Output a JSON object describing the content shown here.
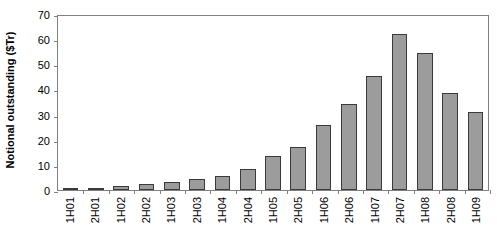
{
  "chart_data": {
    "type": "bar",
    "title": "",
    "xlabel": "",
    "ylabel": "Notional outstanding ($Tr)",
    "ylim": [
      0,
      70
    ],
    "yticks": [
      0,
      10,
      20,
      30,
      40,
      50,
      60,
      70
    ],
    "grid": false,
    "legend": null,
    "bar_color": "#9c9c9c",
    "bar_border_color": "#3a3a3a",
    "axis_color": "#808080",
    "categories": [
      "1H01",
      "2H01",
      "1H02",
      "2H02",
      "1H03",
      "2H03",
      "1H04",
      "2H04",
      "1H05",
      "2H05",
      "1H06",
      "2H06",
      "1H07",
      "2H07",
      "1H08",
      "2H08",
      "1H09"
    ],
    "values": [
      0.6,
      0.9,
      1.6,
      2.2,
      3.0,
      4.4,
      5.7,
      8.4,
      13.4,
      17.1,
      26.0,
      34.4,
      45.5,
      62.2,
      54.6,
      38.6,
      31.2
    ]
  }
}
